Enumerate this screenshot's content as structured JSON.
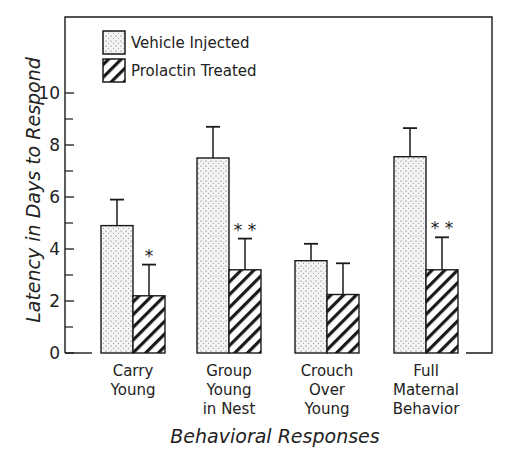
{
  "chart_data": {
    "type": "bar",
    "title": "",
    "xlabel": "Behavioral Responses",
    "ylabel": "Latency in Days to Respond",
    "ylim": [
      0,
      10
    ],
    "yticks": [
      0,
      2,
      4,
      6,
      8,
      10
    ],
    "minor_yticks": [
      1,
      3,
      5,
      7,
      9
    ],
    "grid": false,
    "legend_position": "upper left (inside frame)",
    "categories": [
      "Carry Young",
      "Group Young in Nest",
      "Crouch Over Young",
      "Full Maternal Behavior"
    ],
    "category_lines": [
      [
        "Carry",
        "Young"
      ],
      [
        "Group",
        "Young",
        "in Nest"
      ],
      [
        "Crouch",
        "Over",
        "Young"
      ],
      [
        "Full",
        "Maternal",
        "Behavior"
      ]
    ],
    "series": [
      {
        "name": "Vehicle Injected",
        "pattern": "stipple",
        "values": [
          4.9,
          7.5,
          3.55,
          7.55
        ],
        "error_upper": [
          5.9,
          8.7,
          4.2,
          8.65
        ]
      },
      {
        "name": "Prolactin Treated",
        "pattern": "diagonal-hatch",
        "values": [
          2.2,
          3.2,
          2.25,
          3.2
        ],
        "error_upper": [
          3.4,
          4.4,
          3.45,
          4.45
        ]
      }
    ],
    "annotations": [
      {
        "category": "Carry Young",
        "series": "Prolactin Treated",
        "text": "*"
      },
      {
        "category": "Group Young in Nest",
        "series": "Prolactin Treated",
        "text": "**"
      },
      {
        "category": "Full Maternal Behavior",
        "series": "Prolactin Treated",
        "text": "**"
      }
    ]
  },
  "colors": {
    "ink": "#1a1a1a",
    "stipple_bg": "#f2f2f2",
    "background": "#ffffff"
  }
}
